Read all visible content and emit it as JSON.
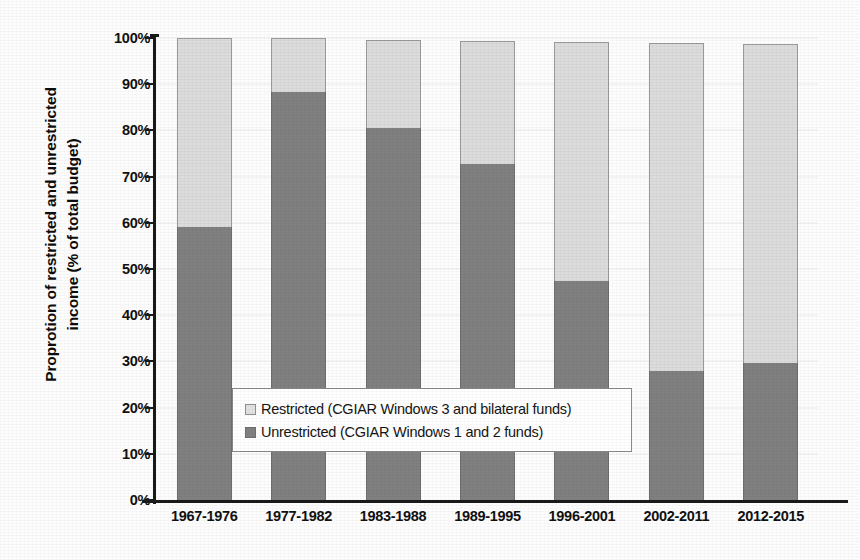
{
  "chart_data": {
    "type": "bar",
    "subtype": "stacked-100-percent",
    "title": "",
    "xlabel": "",
    "ylabel": "Proprotion of restricted and unrestricted income (% of total budget)",
    "ylabel_lines": [
      "Proprotion of restricted and unrestricted",
      "income (% of total budget)"
    ],
    "categories": [
      "1967-1976",
      "1977-1982",
      "1983-1988",
      "1989-1995",
      "1996-2001",
      "2002-2011",
      "2012-2015"
    ],
    "series": [
      {
        "name": "Unrestricted (CGIAR Windows 1 and 2 funds)",
        "color": "#808080",
        "values": [
          59,
          88.3,
          80.6,
          72.8,
          47.5,
          27.9,
          29.6
        ]
      },
      {
        "name": "Restricted (CGIAR Windows 3 and bilateral funds)",
        "color": "#dcdcdc",
        "values": [
          41,
          11.7,
          18.9,
          26.6,
          51.6,
          71.1,
          69.1
        ]
      }
    ],
    "bar_totals": [
      100,
      100,
      99.5,
      99.4,
      99.1,
      99.0,
      98.7
    ],
    "ylim": [
      0,
      100
    ],
    "ytick_values": [
      0,
      10,
      20,
      30,
      40,
      50,
      60,
      70,
      80,
      90,
      100
    ],
    "ytick_labels": [
      "0%",
      "10%",
      "20%",
      "30%",
      "40%",
      "50%",
      "60%",
      "70%",
      "80%",
      "90%",
      "100%"
    ],
    "grid": true,
    "legend_position": "center",
    "legend": [
      {
        "label": "Restricted (CGIAR Windows 3 and bilateral funds)",
        "swatch": "restricted",
        "color": "#dcdcdc"
      },
      {
        "label": "Unrestricted (CGIAR Windows 1 and 2 funds)",
        "swatch": "unrestricted",
        "color": "#808080"
      }
    ]
  }
}
